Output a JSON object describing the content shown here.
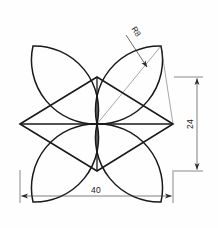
{
  "drawing": {
    "type": "engineering-line-drawing",
    "subject": "four-point-star-with-petal-arcs",
    "background_color": "#fefefe",
    "line_color": "#1a1a1a",
    "construction_line_color": "#3a3a3a",
    "dimension_color": "#2a2a2a"
  },
  "dimensions": {
    "width": {
      "value": "40",
      "orientation": "horizontal",
      "position": "bottom"
    },
    "height": {
      "value": "24",
      "orientation": "vertical",
      "position": "right"
    },
    "radius": {
      "value": "R8",
      "orientation": "leader",
      "position": "upper-right"
    }
  },
  "geometry": {
    "center": {
      "x": 97,
      "y": 124
    },
    "vertices": {
      "left": {
        "x": 20,
        "y": 124
      },
      "right": {
        "x": 173,
        "y": 124
      },
      "top": {
        "x": 97,
        "y": 77
      },
      "bottom": {
        "x": 97,
        "y": 171
      }
    },
    "star_path": "M 20 124 L 97 77 L 173 124 L 97 171 Z",
    "horizontal_axis": "M 20 124 L 173 124",
    "vertical_axis": "M 97 77 L 97 171",
    "petals": [
      {
        "name": "petal-top-left",
        "path": "M 97 124 A 64 64 0 0 1 33 46 A 64 64 0 0 1 97 124"
      },
      {
        "name": "petal-top-right",
        "path": "M 97 124 A 64 64 0 0 0 161 46 A 64 64 0 0 0 97 124"
      },
      {
        "name": "petal-bottom-left",
        "path": "M 97 124 A 64 64 0 0 0 33 202 A 64 64 0 0 0 97 124"
      },
      {
        "name": "petal-bottom-right",
        "path": "M 97 124 A 64 64 0 0 1 161 202 A 64 64 0 0 1 97 124"
      }
    ],
    "construction_lines": [
      "M 97 124 L 161 46",
      "M 161 46 L 173 124",
      "M 97 124 L 173 124"
    ]
  },
  "annotations": {
    "width_dim_y": 196,
    "width_dim_x1": 20,
    "width_dim_x2": 173,
    "height_dim_x": 197,
    "height_dim_y1": 77,
    "height_dim_y2": 171,
    "leader_start": {
      "x": 126,
      "y": 35
    },
    "leader_end": {
      "x": 146,
      "y": 66
    }
  }
}
